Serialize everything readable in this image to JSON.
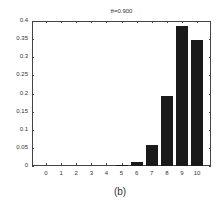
{
  "chart_data": {
    "type": "bar",
    "title": "θ=0.900",
    "xlabel": "",
    "ylabel": "",
    "categories": [
      "0",
      "1",
      "2",
      "3",
      "4",
      "5",
      "6",
      "7",
      "8",
      "9",
      "10"
    ],
    "values": [
      0.0,
      0.0,
      0.0,
      0.0,
      0.0001,
      0.0015,
      0.0112,
      0.0574,
      0.1937,
      0.3874,
      0.3487
    ],
    "ylim": [
      0,
      0.4
    ],
    "yticks": [
      "0",
      "0.05",
      "0.1",
      "0.15",
      "0.2",
      "0.25",
      "0.3",
      "0.35",
      "0.4"
    ],
    "grid": false,
    "legend": null,
    "bar_color": "#1a1a1a"
  },
  "caption": "(b)"
}
